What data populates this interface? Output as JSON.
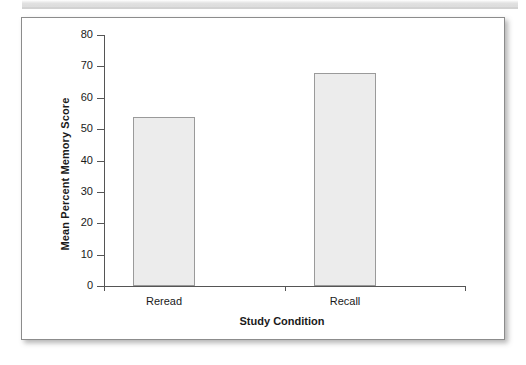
{
  "figure": {
    "background_color": "#ffffff",
    "border_color": "#8c8c8c",
    "bar_fill_color": "#ececec",
    "bar_edge_color": "#9a9a9a",
    "axis_color": "#555555"
  },
  "chart_data": {
    "type": "bar",
    "title": "",
    "xlabel": "Study Condition",
    "ylabel": "Mean Percent Memory Score",
    "categories": [
      "Reread",
      "Recall"
    ],
    "values": [
      54,
      68
    ],
    "ylim": [
      0,
      80
    ],
    "yticks": [
      0,
      10,
      20,
      30,
      40,
      50,
      60,
      70,
      80
    ],
    "ytick_labels": [
      "0",
      "10",
      "20",
      "30",
      "40",
      "50",
      "60",
      "70",
      "80"
    ],
    "grid": false,
    "legend": null
  }
}
